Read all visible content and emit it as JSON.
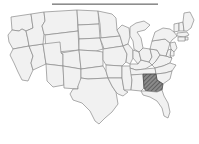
{
  "page": {
    "background_color": "#ffffff"
  },
  "top_rule": {
    "name": "horizontal-rule",
    "color": "#8d8d8d",
    "x": 52,
    "y": 3,
    "width": 106,
    "height": 2
  },
  "map": {
    "name": "us-states-map",
    "caption": "",
    "projection": "albers-usa",
    "state_fill": "#f1f1f1",
    "state_border": "#8a8a8a",
    "highlight_fill": "#808080",
    "highlight_border": "#4a4a4a",
    "highlight_pattern": "diagonal-hatch",
    "highlighted_states": [
      "Georgia"
    ],
    "states": [
      {
        "code": "WA",
        "name": "Washington",
        "highlighted": false
      },
      {
        "code": "OR",
        "name": "Oregon",
        "highlighted": false
      },
      {
        "code": "CA",
        "name": "California",
        "highlighted": false
      },
      {
        "code": "NV",
        "name": "Nevada",
        "highlighted": false
      },
      {
        "code": "ID",
        "name": "Idaho",
        "highlighted": false
      },
      {
        "code": "MT",
        "name": "Montana",
        "highlighted": false
      },
      {
        "code": "WY",
        "name": "Wyoming",
        "highlighted": false
      },
      {
        "code": "UT",
        "name": "Utah",
        "highlighted": false
      },
      {
        "code": "AZ",
        "name": "Arizona",
        "highlighted": false
      },
      {
        "code": "CO",
        "name": "Colorado",
        "highlighted": false
      },
      {
        "code": "NM",
        "name": "New Mexico",
        "highlighted": false
      },
      {
        "code": "ND",
        "name": "North Dakota",
        "highlighted": false
      },
      {
        "code": "SD",
        "name": "South Dakota",
        "highlighted": false
      },
      {
        "code": "NE",
        "name": "Nebraska",
        "highlighted": false
      },
      {
        "code": "KS",
        "name": "Kansas",
        "highlighted": false
      },
      {
        "code": "OK",
        "name": "Oklahoma",
        "highlighted": false
      },
      {
        "code": "TX",
        "name": "Texas",
        "highlighted": false
      },
      {
        "code": "MN",
        "name": "Minnesota",
        "highlighted": false
      },
      {
        "code": "IA",
        "name": "Iowa",
        "highlighted": false
      },
      {
        "code": "MO",
        "name": "Missouri",
        "highlighted": false
      },
      {
        "code": "AR",
        "name": "Arkansas",
        "highlighted": false
      },
      {
        "code": "LA",
        "name": "Louisiana",
        "highlighted": false
      },
      {
        "code": "WI",
        "name": "Wisconsin",
        "highlighted": false
      },
      {
        "code": "IL",
        "name": "Illinois",
        "highlighted": false
      },
      {
        "code": "MS",
        "name": "Mississippi",
        "highlighted": false
      },
      {
        "code": "MI",
        "name": "Michigan",
        "highlighted": false
      },
      {
        "code": "IN",
        "name": "Indiana",
        "highlighted": false
      },
      {
        "code": "KY",
        "name": "Kentucky",
        "highlighted": false
      },
      {
        "code": "TN",
        "name": "Tennessee",
        "highlighted": false
      },
      {
        "code": "AL",
        "name": "Alabama",
        "highlighted": false
      },
      {
        "code": "OH",
        "name": "Ohio",
        "highlighted": false
      },
      {
        "code": "WV",
        "name": "West Virginia",
        "highlighted": false
      },
      {
        "code": "VA",
        "name": "Virginia",
        "highlighted": false
      },
      {
        "code": "NC",
        "name": "North Carolina",
        "highlighted": false
      },
      {
        "code": "SC",
        "name": "South Carolina",
        "highlighted": false
      },
      {
        "code": "GA",
        "name": "Georgia",
        "highlighted": true
      },
      {
        "code": "FL",
        "name": "Florida",
        "highlighted": false
      },
      {
        "code": "PA",
        "name": "Pennsylvania",
        "highlighted": false
      },
      {
        "code": "NY",
        "name": "New York",
        "highlighted": false
      },
      {
        "code": "VT",
        "name": "Vermont",
        "highlighted": false
      },
      {
        "code": "NH",
        "name": "New Hampshire",
        "highlighted": false
      },
      {
        "code": "ME",
        "name": "Maine",
        "highlighted": false
      },
      {
        "code": "MA",
        "name": "Massachusetts",
        "highlighted": false
      },
      {
        "code": "RI",
        "name": "Rhode Island",
        "highlighted": false
      },
      {
        "code": "CT",
        "name": "Connecticut",
        "highlighted": false
      },
      {
        "code": "NJ",
        "name": "New Jersey",
        "highlighted": false
      },
      {
        "code": "DE",
        "name": "Delaware",
        "highlighted": false
      },
      {
        "code": "MD",
        "name": "Maryland",
        "highlighted": false
      }
    ]
  }
}
